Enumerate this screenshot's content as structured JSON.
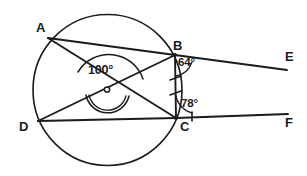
{
  "figure": {
    "canvas": {
      "width": 307,
      "height": 176
    },
    "background_color": "#ffffff",
    "ink_color": "#1b1b1b"
  },
  "points": {
    "A": {
      "label": "A",
      "x": 48,
      "y": 38,
      "label_x": 36,
      "label_y": 21
    },
    "B": {
      "label": "B",
      "x": 175,
      "y": 55,
      "label_x": 173,
      "label_y": 39
    },
    "C": {
      "label": "C",
      "x": 176,
      "y": 118,
      "label_x": 179,
      "label_y": 120
    },
    "D": {
      "label": "D",
      "x": 38,
      "y": 121,
      "label_x": 19,
      "label_y": 120
    },
    "E": {
      "label": "E",
      "x": 287,
      "y": 70,
      "label_x": 285,
      "label_y": 50
    },
    "F": {
      "label": "F",
      "x": 288,
      "y": 114,
      "label_x": 285,
      "label_y": 116
    },
    "O": {
      "label": "",
      "x": 107,
      "y": 90,
      "label_x": 0,
      "label_y": 0
    }
  },
  "angles": [
    {
      "name": "angle-at-centre",
      "value": "100°",
      "vertex": "O",
      "label_x": 88,
      "label_y": 64
    },
    {
      "name": "angle-at-b",
      "value": "64°",
      "vertex": "B",
      "label_x": 178,
      "label_y": 57
    },
    {
      "name": "angle-at-c",
      "value": "78°",
      "vertex": "C",
      "label_x": 181,
      "label_y": 98
    }
  ],
  "segments": [
    {
      "name": "chord-AB",
      "from": "A",
      "to": "B"
    },
    {
      "name": "chord-AC",
      "from": "A",
      "to": "C"
    },
    {
      "name": "chord-DB",
      "from": "D",
      "to": "B"
    },
    {
      "name": "chord-DC",
      "from": "D",
      "to": "C"
    },
    {
      "name": "chord-BC",
      "from": "B",
      "to": "C"
    },
    {
      "name": "ray-BE",
      "from": "B",
      "to": "E"
    },
    {
      "name": "ray-CF",
      "from": "C",
      "to": "F"
    }
  ],
  "marks": {
    "bc_ticks": 2,
    "cf_ticks": 1,
    "centre_marker": "open-dot",
    "reflex_arc": "double-arc"
  },
  "labels_order": [
    "A",
    "B",
    "C",
    "D",
    "E",
    "F"
  ]
}
